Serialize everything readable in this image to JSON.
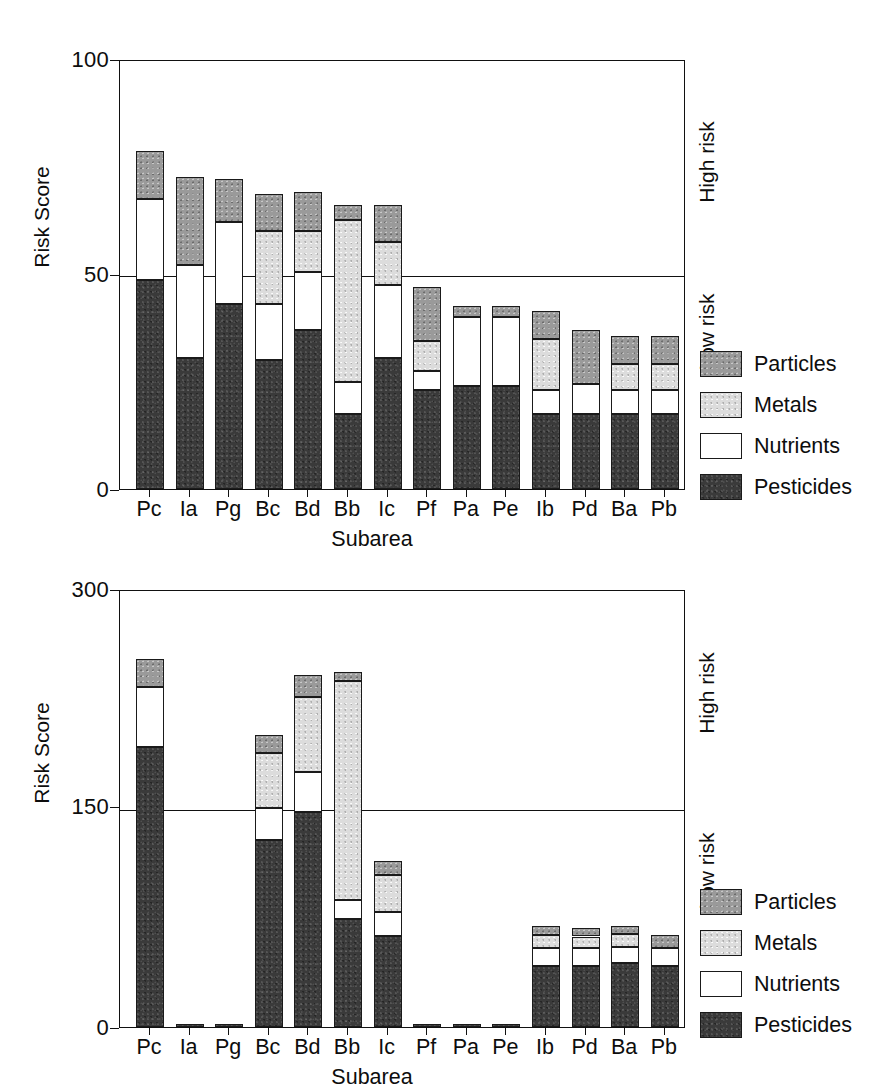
{
  "chart_data": [
    {
      "type": "bar",
      "subtype": "stacked-vertical",
      "title": "",
      "xlabel": "Subarea",
      "ylabel": "Risk Score",
      "ylim": [
        0,
        100
      ],
      "yticks": [
        0,
        50,
        100
      ],
      "ytick_labels": [
        "0",
        "50",
        "100"
      ],
      "grid": true,
      "gridlines": [
        50
      ],
      "legend_position": "right-bottom",
      "categories": [
        "Pc",
        "Ia",
        "Pg",
        "Bc",
        "Bd",
        "Bb",
        "Ic",
        "Pf",
        "Pa",
        "Pe",
        "Ib",
        "Pd",
        "Ba",
        "Pb"
      ],
      "series": [
        {
          "name": "Pesticides",
          "color": "#3a3a3a",
          "values": [
            48.5,
            30.5,
            43.0,
            30.0,
            37.0,
            17.5,
            30.5,
            23.0,
            24.0,
            24.0,
            17.5,
            17.5,
            17.5,
            17.5
          ]
        },
        {
          "name": "Nutrients",
          "color": "#ffffff",
          "values": [
            19.0,
            21.5,
            19.0,
            13.0,
            13.5,
            7.5,
            17.0,
            4.5,
            16.0,
            16.0,
            5.5,
            7.0,
            5.5,
            5.5
          ]
        },
        {
          "name": "Metals",
          "color": "#dcdcdc",
          "values": [
            0.0,
            0.0,
            0.0,
            17.0,
            9.5,
            37.5,
            10.0,
            7.0,
            0.0,
            0.0,
            12.0,
            0.0,
            6.0,
            6.0
          ]
        },
        {
          "name": "Particles",
          "color": "#9a9a9a",
          "values": [
            11.0,
            20.5,
            10.0,
            8.5,
            9.0,
            3.5,
            8.5,
            12.5,
            2.5,
            2.5,
            6.5,
            12.5,
            6.5,
            6.5
          ]
        }
      ],
      "totals": [
        78.5,
        72.5,
        72.0,
        68.5,
        69.0,
        66.0,
        66.0,
        47.0,
        42.5,
        42.5,
        41.5,
        37.0,
        35.5,
        35.5
      ],
      "annotations": {
        "above_threshold": "High risk",
        "below_threshold": "Low risk",
        "threshold": 50
      }
    },
    {
      "type": "bar",
      "subtype": "stacked-vertical",
      "title": "",
      "xlabel": "Subarea",
      "ylabel": "Risk Score",
      "ylim": [
        0,
        300
      ],
      "yticks": [
        0,
        150,
        300
      ],
      "ytick_labels": [
        "0",
        "150",
        "300"
      ],
      "grid": true,
      "gridlines": [
        150
      ],
      "legend_position": "right-bottom",
      "categories": [
        "Pc",
        "Ia",
        "Pg",
        "Bc",
        "Bd",
        "Bb",
        "Ic",
        "Pf",
        "Pa",
        "Pe",
        "Ib",
        "Pd",
        "Ba",
        "Pb"
      ],
      "series": [
        {
          "name": "Pesticides",
          "color": "#3a3a3a",
          "values": [
            192,
            2,
            2,
            128,
            147,
            74,
            62,
            2,
            2,
            2,
            42,
            42,
            44,
            42
          ]
        },
        {
          "name": "Nutrients",
          "color": "#ffffff",
          "values": [
            41,
            0,
            0,
            22,
            28,
            13,
            17,
            0,
            0,
            0,
            12,
            12,
            11,
            12
          ]
        },
        {
          "name": "Metals",
          "color": "#dcdcdc",
          "values": [
            0,
            0,
            0,
            38,
            51,
            150,
            25,
            0,
            0,
            0,
            9,
            8,
            9,
            0
          ]
        },
        {
          "name": "Particles",
          "color": "#9a9a9a",
          "values": [
            19,
            0,
            0,
            12,
            15,
            6,
            10,
            0,
            0,
            0,
            6,
            6,
            5,
            9
          ]
        }
      ],
      "totals": [
        252,
        2,
        2,
        200,
        241,
        243,
        114,
        2,
        2,
        2,
        69,
        68,
        69,
        63
      ],
      "annotations": {
        "above_threshold": "High risk",
        "below_threshold": "Low risk",
        "threshold": 150
      }
    }
  ],
  "charts": [
    {
      "id": "top-chart",
      "y_axis_title": "Risk Score",
      "x_axis_title": "Subarea",
      "y_ticks": [
        "100",
        "50",
        "0"
      ],
      "x_ticks": [
        "Pc",
        "Ia",
        "Pg",
        "Bc",
        "Bd",
        "Bb",
        "Ic",
        "Pf",
        "Pa",
        "Pe",
        "Ib",
        "Pd",
        "Ba",
        "Pb"
      ],
      "risk_high": "High risk",
      "risk_low": "Low risk",
      "legend": [
        {
          "label": "Particles",
          "swatch": "particles"
        },
        {
          "label": "Metals",
          "swatch": "metals"
        },
        {
          "label": "Nutrients",
          "swatch": "nutrients"
        },
        {
          "label": "Pesticides",
          "swatch": "pesticides"
        }
      ]
    },
    {
      "id": "bottom-chart",
      "y_axis_title": "Risk Score",
      "x_axis_title": "Subarea",
      "y_ticks": [
        "300",
        "150",
        "0"
      ],
      "x_ticks": [
        "Pc",
        "Ia",
        "Pg",
        "Bc",
        "Bd",
        "Bb",
        "Ic",
        "Pf",
        "Pa",
        "Pe",
        "Ib",
        "Pd",
        "Ba",
        "Pb"
      ],
      "risk_high": "High risk",
      "risk_low": "Low risk",
      "legend": [
        {
          "label": "Particles",
          "swatch": "particles"
        },
        {
          "label": "Metals",
          "swatch": "metals"
        },
        {
          "label": "Nutrients",
          "swatch": "nutrients"
        },
        {
          "label": "Pesticides",
          "swatch": "pesticides"
        }
      ]
    }
  ],
  "colors": {
    "particles": "#9a9a9a",
    "metals": "#dcdcdc",
    "nutrients": "#ffffff",
    "pesticides": "#3a3a3a",
    "axis": "#111111"
  }
}
